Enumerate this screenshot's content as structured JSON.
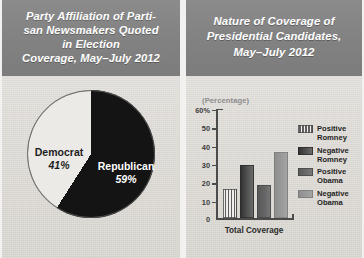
{
  "left_panel": {
    "title_lines": [
      "Party Affiliation of Parti-",
      "san Newsmakers Quoted",
      "in Election",
      "Coverage, May–July 2012"
    ],
    "chart_data": {
      "type": "pie",
      "title": "Party Affiliation of Partisan Newsmakers Quoted in Election Coverage, May–July 2012",
      "xlabel": "",
      "ylabel": "",
      "legend_position": "on-slice",
      "grid": false,
      "categories": [
        "Republican",
        "Democrat"
      ],
      "values": [
        59,
        41
      ],
      "unit": "%",
      "slices": [
        {
          "label": "Republican",
          "value": 59,
          "value_label": "59%",
          "color": "#141414",
          "text_color": "#ffffff"
        },
        {
          "label": "Democrat",
          "value": 41,
          "value_label": "41%",
          "color": "#eceae6",
          "text_color": "#1d1d1d"
        }
      ]
    }
  },
  "right_panel": {
    "title_lines": [
      "Nature of Coverage of",
      "Presidential Candidates,",
      "May–July 2012"
    ],
    "chart_data": {
      "type": "bar",
      "title": "Nature of Coverage of Presidential Candidates, May–July 2012",
      "axis_caption": "(Percentage)",
      "xlabel": "Total Coverage",
      "ylabel": "(Percentage)",
      "categories": [
        "Total Coverage"
      ],
      "ylim": [
        0,
        60
      ],
      "yticks": [
        0,
        10,
        20,
        30,
        40,
        50,
        60
      ],
      "ytick_labels": [
        "0",
        "10",
        "20",
        "30",
        "40",
        "50",
        "60%"
      ],
      "grid": false,
      "legend_position": "right",
      "series": [
        {
          "name": "Positive Romney",
          "values": [
            16
          ],
          "color": "#5e5e5e",
          "pattern": "vertical-stripes"
        },
        {
          "name": "Negative Romney",
          "values": [
            29
          ],
          "color": "#3a3a3a",
          "pattern": "solid"
        },
        {
          "name": "Positive Obama",
          "values": [
            18
          ],
          "color": "#656565",
          "pattern": "solid"
        },
        {
          "name": "Negative Obama",
          "values": [
            36
          ],
          "color": "#9a9a9a",
          "pattern": "solid"
        }
      ]
    }
  },
  "colors": {
    "panel_background": "#dedbd6",
    "header_background": "#828282",
    "header_text": "#ffffff",
    "axis": "#4b4b4b",
    "caption_text": "#8c8c8c"
  }
}
